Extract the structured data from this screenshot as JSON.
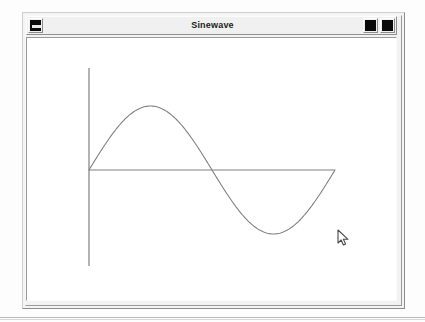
{
  "window": {
    "title": "Sinewave",
    "titlebar_buttons": [
      {
        "name": "window-menu-button",
        "icon": "window-menu-icon",
        "label": ""
      },
      {
        "name": "iconify-button",
        "icon": "iconify-icon",
        "label": ""
      },
      {
        "name": "maximize-button",
        "icon": "maximize-icon",
        "label": ""
      }
    ]
  },
  "colors": {
    "window_background": "#f2f2f2",
    "titlebar_background": "#f0f0f0",
    "canvas_background": "#ffffff",
    "axis_color": "#808080",
    "curve_color": "#808080",
    "title_text": "#1c1c1c",
    "button_glyph": "#0a0a0a"
  },
  "chart_data": {
    "type": "line",
    "title": "",
    "xlabel": "",
    "ylabel": "",
    "function": "y = sin(x)",
    "x": [
      0,
      0.3927,
      0.7854,
      1.1781,
      1.5708,
      1.9635,
      2.3562,
      2.7489,
      3.1416,
      3.5343,
      3.927,
      4.3197,
      4.7124,
      5.1051,
      5.4978,
      5.8905,
      6.2832
    ],
    "values": [
      0,
      0.3827,
      0.7071,
      0.9239,
      1,
      0.9239,
      0.7071,
      0.3827,
      0,
      -0.3827,
      -0.7071,
      -0.9239,
      -1,
      -0.9239,
      -0.7071,
      -0.3827,
      0
    ],
    "xlim": [
      0,
      6.2832
    ],
    "ylim": [
      -1,
      1
    ],
    "grid": false,
    "legend": null,
    "series": [
      {
        "name": "sine",
        "values": [
          0,
          0.3827,
          0.7071,
          0.9239,
          1,
          0.9239,
          0.7071,
          0.3827,
          0,
          -0.3827,
          -0.7071,
          -0.9239,
          -1,
          -0.9239,
          -0.7071,
          -0.3827,
          0
        ]
      }
    ],
    "axes": {
      "x_axis_drawn": true,
      "y_axis_drawn": true,
      "x_tick_labels": [],
      "y_tick_labels": []
    }
  },
  "cursor": {
    "type": "arrow-pointer",
    "x": 341,
    "y": 234
  }
}
